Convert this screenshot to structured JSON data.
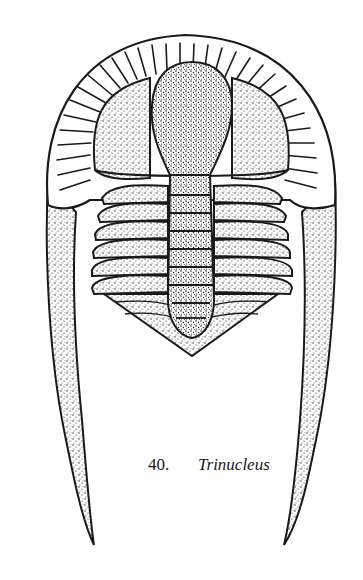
{
  "figure": {
    "number": "40.",
    "taxon": "Trinucleus",
    "colors": {
      "ink": "#1a1a1a",
      "paper": "#ffffff"
    },
    "thorax_segments": 6
  }
}
